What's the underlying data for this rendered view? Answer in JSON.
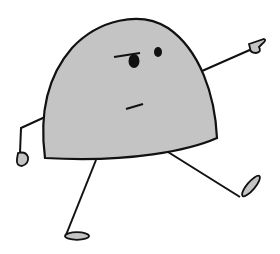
{
  "figure": {
    "colors": {
      "background": "#ffffff",
      "body_fill": "#c4c4c4",
      "outline": "#111111",
      "foot_fill": "#c4c4c4"
    }
  }
}
